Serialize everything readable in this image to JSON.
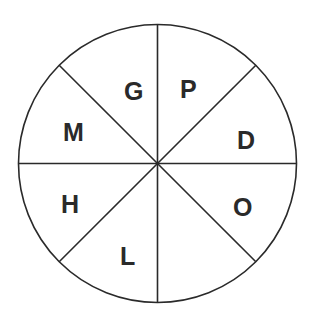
{
  "diagram": {
    "type": "divided-circle",
    "sector_count": 8,
    "center": {
      "x": 157.5,
      "y": 163.5
    },
    "radius": 139,
    "line_color": "#2a2a2a",
    "background": "#ffffff",
    "sectors": [
      {
        "position": "top-left-upper",
        "label": "G"
      },
      {
        "position": "top-right-upper",
        "label": "P"
      },
      {
        "position": "right-upper",
        "label": "D"
      },
      {
        "position": "right-lower",
        "label": "O"
      },
      {
        "position": "bottom-right",
        "label": ""
      },
      {
        "position": "bottom-left",
        "label": "L"
      },
      {
        "position": "left-lower",
        "label": "H"
      },
      {
        "position": "left-upper",
        "label": "M"
      }
    ]
  }
}
